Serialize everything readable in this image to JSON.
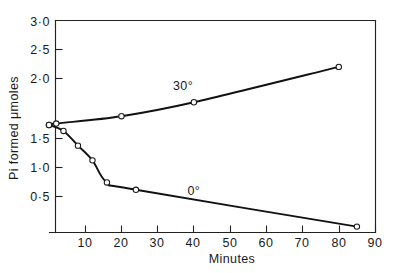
{
  "chart_data": {
    "type": "line",
    "title": "",
    "xlabel": "Minutes",
    "ylabel": "Pi formed μmoles",
    "xlim": [
      0,
      90
    ],
    "ylim": [
      0.12,
      3.0
    ],
    "grid": false,
    "legend_position": "inline-annotation",
    "xticks": [
      10,
      20,
      30,
      40,
      50,
      60,
      70,
      80,
      90
    ],
    "xtick_labels": [
      "10",
      "20",
      "30",
      "40",
      "50",
      "60",
      "70",
      "80",
      "90"
    ],
    "yticks": [
      0.5,
      1.0,
      1.5,
      2.0,
      2.5,
      3.0
    ],
    "ytick_labels": [
      "0·5",
      "1·0",
      "1·5",
      "2·0",
      "2·5",
      "3·0"
    ],
    "series": [
      {
        "name": "30°",
        "label": "30°",
        "label_x": 37,
        "label_y": 2.06,
        "color": "#111111",
        "x": [
          0,
          2,
          20,
          40,
          80
        ],
        "values": [
          1.58,
          1.6,
          1.7,
          1.89,
          2.37
        ]
      },
      {
        "name": "0°",
        "label": "0°",
        "label_x": 40,
        "label_y": 0.63,
        "color": "#111111",
        "x": [
          0,
          4,
          8,
          12,
          16,
          24,
          85
        ],
        "values": [
          1.58,
          1.5,
          1.3,
          1.1,
          0.8,
          0.7,
          0.2
        ]
      }
    ]
  },
  "axes": {
    "y_axis_title": "Pi formed μmoles",
    "x_axis_title": "Minutes",
    "y_tick_labels": [
      "3·0",
      "2·5",
      "2·0",
      "1·5",
      "1·0",
      "0·5"
    ],
    "x_tick_labels": [
      "10",
      "20",
      "30",
      "40",
      "50",
      "60",
      "70",
      "80",
      "90"
    ]
  },
  "annotations": {
    "series_30": "30°",
    "series_0": "0°"
  },
  "colors": {
    "ink": "#1a1a1a",
    "curve": "#111111",
    "background": "#ffffff",
    "marker_fill": "#ffffff"
  }
}
